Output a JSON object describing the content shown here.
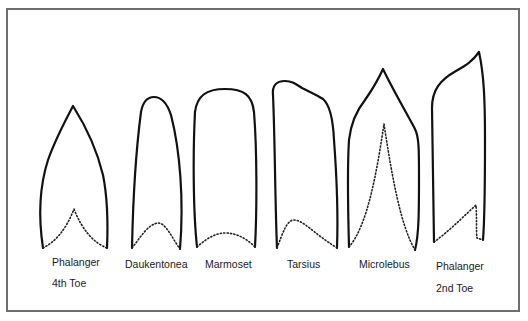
{
  "diagram": {
    "type": "comparative-outline-drawing",
    "colors": {
      "outline": "#111111",
      "frame": "#6e6e6e",
      "background": "#ffffff"
    },
    "specimens": [
      {
        "id": "phalanger-4th",
        "label": "Phalanger",
        "sublabel": "4th Toe"
      },
      {
        "id": "daukentonea",
        "label": "Daukentonea"
      },
      {
        "id": "marmoset",
        "label": "Marmoset"
      },
      {
        "id": "tarsius",
        "label": "Tarsius"
      },
      {
        "id": "microlebus",
        "label": "Microlebus"
      },
      {
        "id": "phalanger-2nd",
        "label": "Phalanger",
        "sublabel": "2nd Toe"
      }
    ]
  }
}
